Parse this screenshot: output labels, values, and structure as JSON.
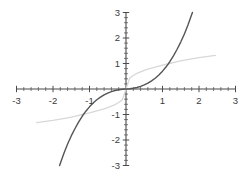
{
  "chart_data": {
    "type": "line",
    "title": "",
    "subtitle": "",
    "xlabel": "",
    "ylabel": "",
    "xlim": [
      -3,
      3
    ],
    "ylim": [
      -3,
      3
    ],
    "grid": false,
    "legend": "none",
    "axes_style": "centered-cross-with-ticks",
    "xticks": [
      -3,
      -2,
      -1,
      1,
      2,
      3
    ],
    "yticks": [
      -3,
      -2,
      -1,
      1,
      2,
      3
    ],
    "xtick_labels": [
      "-3",
      "-2",
      "-1",
      "1",
      "2",
      "3"
    ],
    "ytick_labels": [
      "-3",
      "-2",
      "-1",
      "1",
      "2",
      "3"
    ],
    "minor_ticks_per_unit": 5,
    "series": [
      {
        "name": "cubic",
        "description": "steep odd function, concave up for x>0, passes through origin, reaches y=3 near x=1.8",
        "color": "#555555",
        "width": 1.4,
        "x": [
          -1.82,
          -1.7,
          -1.6,
          -1.5,
          -1.4,
          -1.3,
          -1.2,
          -1.1,
          -1.0,
          -0.9,
          -0.8,
          -0.7,
          -0.6,
          -0.5,
          -0.4,
          -0.3,
          -0.2,
          -0.1,
          0,
          0.1,
          0.2,
          0.3,
          0.4,
          0.5,
          0.6,
          0.7,
          0.8,
          0.9,
          1.0,
          1.1,
          1.2,
          1.3,
          1.4,
          1.5,
          1.6,
          1.7,
          1.82
        ],
        "y": [
          -3.0,
          -2.52,
          -2.16,
          -1.84,
          -1.56,
          -1.3,
          -1.07,
          -0.87,
          -0.7,
          -0.55,
          -0.42,
          -0.32,
          -0.23,
          -0.16,
          -0.1,
          -0.06,
          -0.03,
          -0.01,
          0,
          0.01,
          0.03,
          0.06,
          0.1,
          0.16,
          0.23,
          0.32,
          0.42,
          0.55,
          0.7,
          0.87,
          1.07,
          1.3,
          1.56,
          1.84,
          2.16,
          2.52,
          3.0
        ]
      },
      {
        "name": "cube-root",
        "description": "faint gray inverse function, concave down for x>0, flattens toward edges",
        "color": "#d8d8d8",
        "width": 1.3,
        "x": [
          -2.45,
          -2.2,
          -2.0,
          -1.8,
          -1.6,
          -1.4,
          -1.2,
          -1.0,
          -0.8,
          -0.6,
          -0.5,
          -0.4,
          -0.3,
          -0.2,
          -0.1,
          0,
          0.1,
          0.2,
          0.3,
          0.4,
          0.5,
          0.6,
          0.8,
          1.0,
          1.2,
          1.4,
          1.6,
          1.8,
          2.0,
          2.2,
          2.45
        ],
        "y": [
          -1.32,
          -1.27,
          -1.23,
          -1.18,
          -1.13,
          -1.07,
          -1.0,
          -0.94,
          -0.86,
          -0.78,
          -0.73,
          -0.67,
          -0.61,
          -0.53,
          -0.42,
          0,
          0.42,
          0.53,
          0.61,
          0.67,
          0.73,
          0.78,
          0.86,
          0.94,
          1.0,
          1.07,
          1.13,
          1.18,
          1.23,
          1.27,
          1.32
        ]
      }
    ],
    "colors": {
      "axis": "#4a4a4a",
      "dark_curve": "#555555",
      "light_curve": "#d8d8d8",
      "tick_text": "#3a3a3a",
      "background": "#ffffff"
    }
  }
}
